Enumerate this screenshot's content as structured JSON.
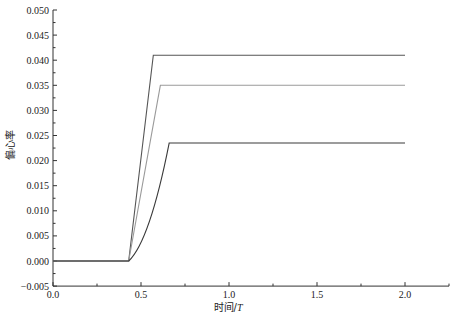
{
  "chart_data": {
    "type": "line",
    "title": "",
    "xlabel": "时间/T",
    "ylabel": "偏心率",
    "xlim": [
      0.0,
      2.25
    ],
    "ylim": [
      -0.005,
      0.05
    ],
    "x_ticks": [
      "0.0",
      "0.5",
      "1.0",
      "1.5",
      "2.0"
    ],
    "y_ticks": [
      "-0.005",
      "0.000",
      "0.005",
      "0.010",
      "0.015",
      "0.020",
      "0.025",
      "0.030",
      "0.035",
      "0.040",
      "0.045",
      "0.050"
    ],
    "grid": false,
    "legend": null,
    "series": [
      {
        "name": "curve-top",
        "color": "#555555",
        "x": [
          0.0,
          0.43,
          0.57,
          2.0
        ],
        "y": [
          0.0,
          0.0,
          0.041,
          0.041
        ]
      },
      {
        "name": "curve-middle",
        "color": "#9a9a9a",
        "x": [
          0.0,
          0.43,
          0.61,
          2.0
        ],
        "y": [
          0.0,
          0.0,
          0.035,
          0.035
        ]
      },
      {
        "name": "curve-bottom",
        "color": "#3a3a3a",
        "x": [
          0.0,
          0.43,
          0.5,
          0.58,
          0.66,
          2.0
        ],
        "y": [
          0.0,
          0.0,
          0.006,
          0.0145,
          0.0235,
          0.0235
        ]
      }
    ]
  },
  "labels": {
    "xlabel_main": "时间/",
    "xlabel_italic": "T",
    "ylabel": "偏心率"
  }
}
